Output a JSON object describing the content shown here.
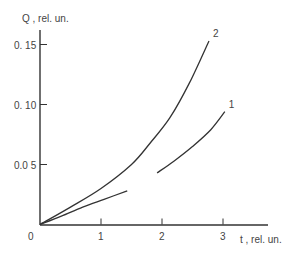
{
  "chart_data": {
    "type": "line",
    "title": "",
    "xlabel": "t , rel. un.",
    "ylabel": "Q , rel. un.",
    "xlim": [
      0,
      3.7
    ],
    "ylim": [
      0,
      0.165
    ],
    "x_ticks": [
      {
        "value": 1,
        "label": "1"
      },
      {
        "value": 2,
        "label": "2"
      },
      {
        "value": 3,
        "label": "3"
      }
    ],
    "y_ticks": [
      {
        "value": 0.05,
        "label": "0.0  5"
      },
      {
        "value": 0.1,
        "label": "0. 10"
      },
      {
        "value": 0.15,
        "label": "0. 15"
      }
    ],
    "origin_label": "0",
    "grid": false,
    "legend": "none",
    "series": [
      {
        "name": "1",
        "segments": [
          {
            "x": [
              0,
              0.35,
              0.7,
              1.05,
              1.43
            ],
            "y": [
              0,
              0.007,
              0.0145,
              0.021,
              0.028
            ]
          },
          {
            "x": [
              1.92,
              2.2,
              2.5,
              2.8,
              3.03
            ],
            "y": [
              0.043,
              0.053,
              0.065,
              0.079,
              0.094
            ]
          }
        ],
        "label_position": "end"
      },
      {
        "name": "2",
        "segments": [
          {
            "x": [
              0,
              0.5,
              1.0,
              1.5,
              1.8,
              2.13,
              2.45,
              2.77
            ],
            "y": [
              0,
              0.0145,
              0.03,
              0.05,
              0.0675,
              0.089,
              0.118,
              0.153
            ]
          }
        ],
        "label_position": "end"
      }
    ]
  }
}
